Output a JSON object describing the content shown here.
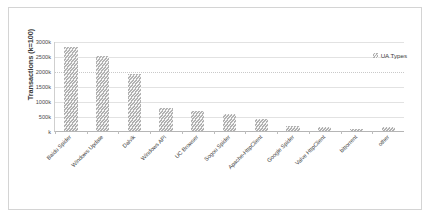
{
  "chart_data": {
    "type": "bar",
    "title": "",
    "xlabel": "",
    "ylabel": "Transactions (k=100)",
    "ylim": [
      0,
      3000
    ],
    "ytick_labels": [
      "3000k",
      "2500k",
      "2000k",
      "1500k",
      "1000k",
      "500k",
      "k"
    ],
    "ytick_values": [
      3000,
      2500,
      2000,
      1500,
      1000,
      500,
      0
    ],
    "grid": true,
    "legend_position": "top-right",
    "legend": [
      "UA Types"
    ],
    "categories": [
      "Baidu Spider",
      "Windows Update",
      "Dalvik",
      "Windows API",
      "UC Browser",
      "Sogou Spider",
      "Apache-HttpClient",
      "Google Spider",
      "Valve HttpClient",
      "bittorrent",
      "other"
    ],
    "series": [
      {
        "name": "UA Types",
        "values": [
          2800,
          2500,
          1900,
          780,
          680,
          560,
          400,
          160,
          150,
          80,
          130
        ]
      }
    ],
    "colors": {
      "bar_fill": "#c6c6c6",
      "gridline": "#e2e2e2",
      "axis": "#b5b5b5",
      "text": "#3f3f3f",
      "frame_border": "#d4d4d4",
      "background": "#ffffff"
    }
  },
  "legend": {
    "label": "UA Types"
  },
  "axes": {
    "y_title": "Transactions (k=100)"
  }
}
